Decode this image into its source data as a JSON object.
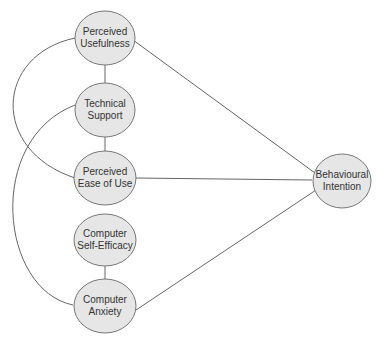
{
  "diagram": {
    "nodes": [
      {
        "id": "pu",
        "line1": "Perceived",
        "line2": "Usefulness"
      },
      {
        "id": "ts",
        "line1": "Technical",
        "line2": "Support"
      },
      {
        "id": "peou",
        "line1": "Perceived",
        "line2": "Ease of Use"
      },
      {
        "id": "cse",
        "line1": "Computer",
        "line2": "Self-Efficacy"
      },
      {
        "id": "ca",
        "line1": "Computer",
        "line2": "Anxiety"
      },
      {
        "id": "bi",
        "line1": "Behavioural",
        "line2": "Intention"
      }
    ],
    "edges": [
      {
        "from": "ts",
        "to": "pu"
      },
      {
        "from": "ts",
        "to": "peou"
      },
      {
        "from": "cse",
        "to": "ca"
      },
      {
        "from": "pu",
        "to": "bi"
      },
      {
        "from": "peou",
        "to": "bi"
      },
      {
        "from": "ca",
        "to": "bi"
      },
      {
        "from": "peou",
        "to": "pu",
        "style": "curve"
      },
      {
        "from": "ca",
        "to": "ts",
        "style": "curve"
      }
    ],
    "colors": {
      "node_fill": "#e6e6e6",
      "node_stroke": "#777777",
      "edge": "#666666"
    }
  }
}
